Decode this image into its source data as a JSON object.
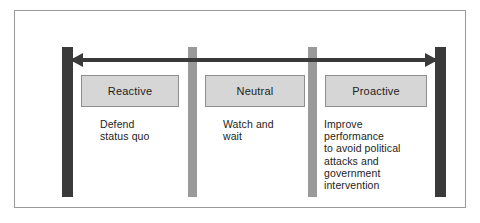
{
  "diagram": {
    "axis": {
      "type": "double-headed-horizontal-arrow",
      "color": "#3a3a3a"
    },
    "dividers": [
      {
        "name": "left-endpoint",
        "style": "dark",
        "color": "#3a3a3a"
      },
      {
        "name": "divider-reactive-neutral",
        "style": "gray",
        "color": "#9a9a9a"
      },
      {
        "name": "divider-neutral-proactive",
        "style": "gray",
        "color": "#9a9a9a"
      },
      {
        "name": "right-endpoint",
        "style": "dark",
        "color": "#3a3a3a"
      }
    ],
    "stages": [
      {
        "key": "reactive",
        "label": "Reactive",
        "description": "Defend\nstatus quo"
      },
      {
        "key": "neutral",
        "label": "Neutral",
        "description": "Watch and\nwait"
      },
      {
        "key": "proactive",
        "label": "Proactive",
        "description": "Improve\nperformance\nto avoid political\nattacks and\ngovernment\nintervention"
      }
    ],
    "colors": {
      "box_fill": "#d6d6d6",
      "box_border": "#8d8d8d",
      "bar_dark": "#3a3a3a",
      "bar_gray": "#9a9a9a",
      "frame_border": "#9b9b9b",
      "background": "#ffffff",
      "text": "#1d1d1d"
    }
  }
}
